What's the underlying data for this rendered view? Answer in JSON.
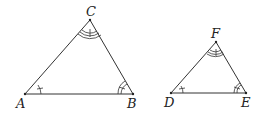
{
  "figure": {
    "triangles": [
      {
        "name": "ABC",
        "vertices": [
          {
            "label": "A",
            "x": 25,
            "y": 94
          },
          {
            "label": "B",
            "x": 133,
            "y": 94
          },
          {
            "label": "C",
            "x": 90,
            "y": 20
          }
        ],
        "angle_marks": {
          "A": "single arc with tick",
          "B": "double arc with tick",
          "C": "triple arc with tick"
        }
      },
      {
        "name": "DEF",
        "vertices": [
          {
            "label": "D",
            "x": 171,
            "y": 93
          },
          {
            "label": "E",
            "x": 246,
            "y": 93
          },
          {
            "label": "F",
            "x": 216,
            "y": 42
          }
        ],
        "angle_marks": {
          "D": "single arc with tick",
          "E": "double arc with tick",
          "F": "triple arc with tick"
        }
      }
    ]
  },
  "labels": {
    "A": "A",
    "B": "B",
    "C": "C",
    "D": "D",
    "E": "E",
    "F": "F"
  }
}
